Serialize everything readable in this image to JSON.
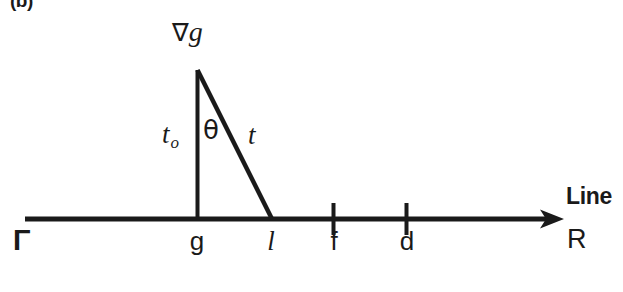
{
  "figure": {
    "panel_label": "(b)",
    "gradient_label": {
      "operator": "∇",
      "variable": "g"
    },
    "angle_label": "θ",
    "leg_label": {
      "symbol": "t",
      "subscript": "o"
    },
    "hypotenuse_label": "t",
    "axis": {
      "left_end_label": "Γ",
      "right_end_label": "R",
      "axis_name": "Line",
      "line_y": 219,
      "x_start": 25,
      "x_end": 560,
      "points": [
        {
          "id": "g",
          "label": "g",
          "x": 197,
          "italic": false,
          "tick": false
        },
        {
          "id": "l",
          "label": "l",
          "x": 270,
          "italic": true,
          "tick": false
        },
        {
          "id": "f",
          "label": "f",
          "x": 333,
          "italic": false,
          "tick": true
        },
        {
          "id": "d",
          "label": "d",
          "x": 406,
          "italic": false,
          "tick": true
        }
      ]
    },
    "triangle": {
      "apex": {
        "x": 197,
        "y": 70
      },
      "foot_vertical": {
        "x": 197,
        "y": 219
      },
      "foot_hypotenuse": {
        "x": 272,
        "y": 219
      }
    },
    "colors": {
      "ink": "#1a1a1a",
      "background": "#ffffff"
    }
  }
}
